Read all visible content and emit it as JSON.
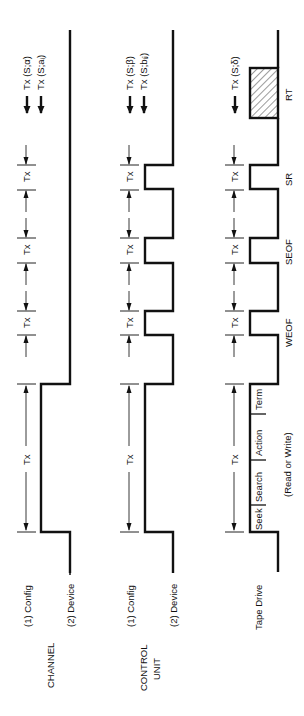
{
  "figure": {
    "columns": [
      {
        "id": "channel",
        "title": "CHANNEL",
        "lines": [
          "(1) Config",
          "(2) Device"
        ],
        "tx_arrows": [
          "Tx (S;α)",
          "Tx (S;aᵢ)"
        ]
      },
      {
        "id": "control-unit",
        "title_line1": "CONTROL",
        "title_line2": "UNIT",
        "lines": [
          "(1) Config",
          "(2) Device"
        ],
        "tx_arrows": [
          "Tx (S;β)",
          "Tx (S;bᵢⱼ)"
        ]
      },
      {
        "id": "tape-drive",
        "title": "Tape Drive",
        "tx_arrows": [
          "Tx (S;δ)"
        ],
        "segments": [
          "Seek",
          "Search",
          "Action",
          "Term"
        ],
        "segment_note": "(Read or Write)",
        "events": [
          "WEOF",
          "SEOF",
          "SR",
          "RT"
        ]
      }
    ],
    "tx_label": "Tx"
  }
}
